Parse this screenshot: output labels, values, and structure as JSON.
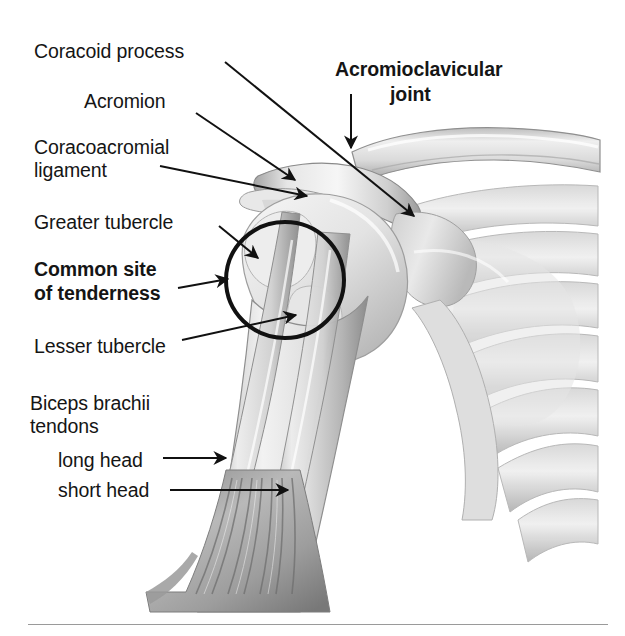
{
  "figure": {
    "background_color": "#ffffff",
    "ink_color": "#151515",
    "divider_color": "#9a9a9a",
    "labels": [
      {
        "id": "coracoid-process",
        "text": "Coracoid process",
        "bold": false,
        "x": 34,
        "y": 40
      },
      {
        "id": "acromion",
        "text": "Acromion",
        "bold": false,
        "x": 84,
        "y": 90
      },
      {
        "id": "coracoacromial",
        "text": "Coracoacromial",
        "bold": false,
        "x": 34,
        "y": 136
      },
      {
        "id": "ligament",
        "text": "ligament",
        "bold": false,
        "x": 34,
        "y": 159
      },
      {
        "id": "greater-tubercle",
        "text": "Greater tubercle",
        "bold": false,
        "x": 34,
        "y": 211
      },
      {
        "id": "common-site",
        "text": "Common site",
        "bold": true,
        "x": 34,
        "y": 258
      },
      {
        "id": "of-tenderness",
        "text": "of tenderness",
        "bold": true,
        "x": 34,
        "y": 282
      },
      {
        "id": "lesser-tubercle",
        "text": "Lesser tubercle",
        "bold": false,
        "x": 34,
        "y": 335
      },
      {
        "id": "biceps-brachii",
        "text": "Biceps brachii",
        "bold": false,
        "x": 30,
        "y": 392
      },
      {
        "id": "tendons",
        "text": "tendons",
        "bold": false,
        "x": 30,
        "y": 415
      },
      {
        "id": "long-head",
        "text": "long head",
        "bold": false,
        "x": 58,
        "y": 449
      },
      {
        "id": "short-head",
        "text": "short head",
        "bold": false,
        "x": 58,
        "y": 479
      },
      {
        "id": "acromioclavicular",
        "text": "Acromioclavicular",
        "bold": true,
        "x": 335,
        "y": 58
      },
      {
        "id": "joint",
        "text": "joint",
        "bold": true,
        "x": 390,
        "y": 83
      }
    ],
    "leaders": [
      {
        "id": "leader-coracoid-process",
        "from": [
          225,
          62
        ],
        "to": [
          414,
          216
        ],
        "arrow": true
      },
      {
        "id": "leader-acromion",
        "from": [
          196,
          113
        ],
        "to": [
          295,
          180
        ],
        "arrow": true
      },
      {
        "id": "leader-coracoacromial",
        "from": [
          160,
          166
        ],
        "to": [
          307,
          196
        ],
        "arrow": true
      },
      {
        "id": "leader-greater-tubercle",
        "from": [
          219,
          226
        ],
        "to": [
          258,
          258
        ],
        "arrow": true
      },
      {
        "id": "leader-common-site",
        "from": [
          178,
          288
        ],
        "to": [
          228,
          279
        ],
        "arrow": true
      },
      {
        "id": "leader-lesser-tubercle",
        "from": [
          182,
          340
        ],
        "to": [
          296,
          315
        ],
        "arrow": true
      },
      {
        "id": "leader-long-head",
        "from": [
          163,
          458
        ],
        "to": [
          226,
          458
        ],
        "arrow": true
      },
      {
        "id": "leader-short-head",
        "from": [
          170,
          490
        ],
        "to": [
          288,
          490
        ],
        "arrow": true
      },
      {
        "id": "leader-acromioclavicular",
        "from": [
          351,
          94
        ],
        "to": [
          351,
          148
        ],
        "arrow": true
      }
    ],
    "highlight_circle": {
      "id": "common-site-of-tenderness-circle",
      "center": [
        285,
        280
      ],
      "radius_x": 59,
      "radius_y": 58,
      "stroke_width": 4,
      "stroke_color": "#111111"
    },
    "structures": [
      "clavicle",
      "acromion",
      "coracoid process",
      "coracoacromial ligament",
      "humeral head",
      "greater tubercle",
      "lesser tubercle",
      "intertubercular (bicipital) groove",
      "humerus shaft",
      "scapula",
      "glenoid",
      "ribs",
      "biceps brachii long head tendon",
      "biceps brachii short head tendon",
      "biceps muscle belly"
    ]
  }
}
